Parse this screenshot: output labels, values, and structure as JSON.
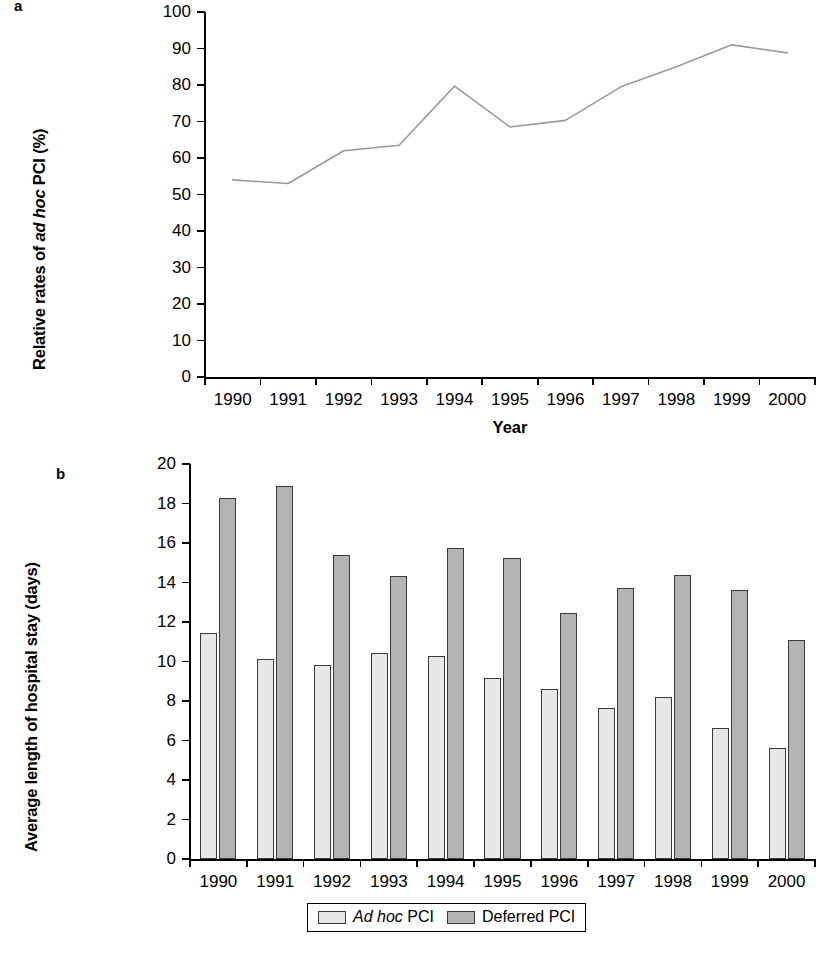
{
  "figure": {
    "panel_a_letter": "a",
    "panel_b_letter": "b"
  },
  "chart_data": [
    {
      "id": "panel-a",
      "type": "line",
      "title": "",
      "panel_label": "a",
      "xlabel": "Year",
      "ylabel": "Relative rates of ad hoc PCI (%)",
      "ylabel_parts": {
        "pre": "Relative rates of ",
        "italic": "ad hoc",
        "post": " PCI (%)"
      },
      "categories": [
        "1990",
        "1991",
        "1992",
        "1993",
        "1994",
        "1995",
        "1996",
        "1997",
        "1998",
        "1999",
        "2000"
      ],
      "values": [
        54.0,
        53.0,
        62.0,
        63.5,
        79.7,
        68.5,
        70.3,
        79.5,
        85.0,
        91.0,
        88.8
      ],
      "ylim": [
        0,
        100
      ],
      "ytick_step": 10,
      "yticks": [
        0,
        10,
        20,
        30,
        40,
        50,
        60,
        70,
        80,
        90,
        100
      ],
      "grid": false,
      "legend": "none",
      "line_color": "#9a9a9a"
    },
    {
      "id": "panel-b",
      "type": "bar",
      "title": "",
      "panel_label": "b",
      "xlabel": "",
      "ylabel": "Average length of hospital stay (days)",
      "categories": [
        "1990",
        "1991",
        "1992",
        "1993",
        "1994",
        "1995",
        "1996",
        "1997",
        "1998",
        "1999",
        "2000"
      ],
      "series": [
        {
          "name": "Ad hoc PCI",
          "name_parts": {
            "italic": "Ad hoc",
            "post": " PCI"
          },
          "color": "#e7e7e7",
          "values": [
            11.45,
            10.15,
            9.8,
            10.45,
            10.3,
            9.15,
            8.6,
            7.65,
            8.2,
            6.65,
            5.6
          ]
        },
        {
          "name": "Deferred PCI",
          "name_parts": {
            "italic": "",
            "post": "Deferred PCI"
          },
          "color": "#b4b4b4",
          "values": [
            18.3,
            18.9,
            15.4,
            14.35,
            15.75,
            15.25,
            12.45,
            13.7,
            14.4,
            13.6,
            11.1
          ]
        }
      ],
      "ylim": [
        0,
        20
      ],
      "ytick_step": 2,
      "yticks": [
        0,
        2,
        4,
        6,
        8,
        10,
        12,
        14,
        16,
        18,
        20
      ],
      "grid": false,
      "legend": "bottom-center"
    }
  ]
}
